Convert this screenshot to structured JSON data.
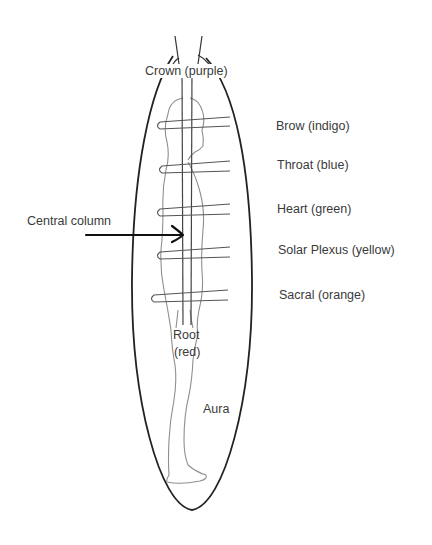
{
  "diagram": {
    "type": "chakra-aura-diagram",
    "labels": {
      "crown": "Crown (purple)",
      "brow": "Brow (indigo)",
      "throat": "Throat (blue)",
      "heart": "Heart (green)",
      "solar_plexus": "Solar Plexus (yellow)",
      "sacral": "Sacral (orange)",
      "root_line1": "Root",
      "root_line2": "(red)",
      "central_column": "Central column",
      "aura": "Aura"
    },
    "chakras": [
      {
        "name": "Crown",
        "color": "purple"
      },
      {
        "name": "Brow",
        "color": "indigo"
      },
      {
        "name": "Throat",
        "color": "blue"
      },
      {
        "name": "Heart",
        "color": "green"
      },
      {
        "name": "Solar Plexus",
        "color": "yellow"
      },
      {
        "name": "Sacral",
        "color": "orange"
      },
      {
        "name": "Root",
        "color": "red"
      }
    ],
    "colors": {
      "outline": "#222222",
      "figure": "#8a8a8a",
      "text": "#3a3a3a",
      "background": "#ffffff"
    }
  }
}
